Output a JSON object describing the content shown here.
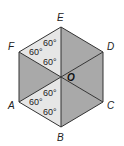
{
  "diagram": {
    "shape": "regular hexagon divided into 6 triangles from center O",
    "colors": {
      "light": "#e6e6e6",
      "dark": "#a9a9a9",
      "stroke": "#333333"
    },
    "center": {
      "label": "O",
      "x": 61,
      "y": 77
    },
    "vertices": [
      {
        "label": "E",
        "x": 61,
        "y": 27,
        "lx": 57,
        "ly": 21
      },
      {
        "label": "D",
        "x": 103,
        "y": 52,
        "lx": 107,
        "ly": 50
      },
      {
        "label": "C",
        "x": 103,
        "y": 102,
        "lx": 107,
        "ly": 109
      },
      {
        "label": "B",
        "x": 61,
        "y": 127,
        "lx": 57,
        "ly": 141
      },
      {
        "label": "A",
        "x": 19,
        "y": 102,
        "lx": 8,
        "ly": 109
      },
      {
        "label": "F",
        "x": 19,
        "y": 52,
        "lx": 8,
        "ly": 50
      }
    ],
    "triangles": [
      {
        "name": "EFO",
        "shade": "light"
      },
      {
        "name": "EDO",
        "shade": "dark"
      },
      {
        "name": "DCO",
        "shade": "dark"
      },
      {
        "name": "CBO",
        "shade": "dark"
      },
      {
        "name": "BAO",
        "shade": "light"
      },
      {
        "name": "AFO",
        "shade": "dark"
      }
    ],
    "angle_labels": [
      {
        "text": "60°",
        "x": 43,
        "y": 46
      },
      {
        "text": "60°",
        "x": 29,
        "y": 55
      },
      {
        "text": "60°",
        "x": 43,
        "y": 65
      },
      {
        "text": "60°",
        "x": 43,
        "y": 96
      },
      {
        "text": "60°",
        "x": 29,
        "y": 105
      },
      {
        "text": "60°",
        "x": 43,
        "y": 115
      }
    ]
  }
}
